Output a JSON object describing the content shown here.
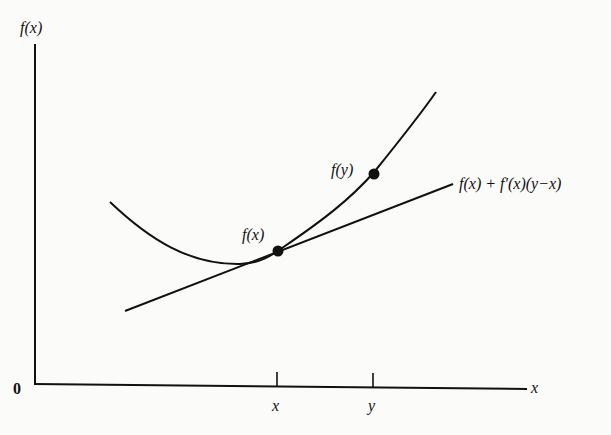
{
  "diagram": {
    "type": "convex-function-tangent-line",
    "axes": {
      "y_label": "f(x)",
      "x_label": "x",
      "origin_label": "0"
    },
    "ticks": [
      {
        "label": "x",
        "px": 277
      },
      {
        "label": "y",
        "px": 373
      }
    ],
    "points": [
      {
        "label": "f(x)",
        "px": 278,
        "py": 251
      },
      {
        "label": "f(y)",
        "px": 374,
        "py": 174
      }
    ],
    "tangent_label": "f(x) + f′(x)(y−x)",
    "colors": {
      "ink": "#111111",
      "background": "#fbfbfa"
    }
  }
}
